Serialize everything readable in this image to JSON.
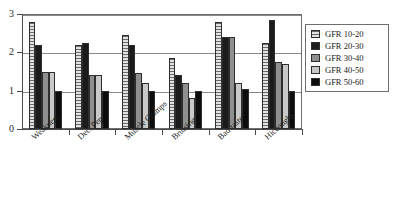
{
  "chart_data": {
    "type": "bar",
    "title": "",
    "subtitle": "",
    "xlabel": "",
    "ylabel": "",
    "ylim": [
      0,
      3
    ],
    "y_ticks": [
      0,
      1,
      2,
      3
    ],
    "y_tick_labels": [
      "0",
      "1",
      "2",
      "3"
    ],
    "grid": true,
    "grid_axis": "y",
    "legend_position": "right",
    "categories": [
      "Weakness",
      "Dec. Pep",
      "Muscle Cramps",
      "Bruising",
      "Bad taste",
      "Hiccoughs"
    ],
    "series": [
      {
        "name": "GFR 10-20",
        "pattern": "horizontal-stripes",
        "color": "#cfcfcf",
        "values": [
          2.8,
          2.2,
          2.45,
          1.85,
          2.8,
          2.25
        ]
      },
      {
        "name": "GFR 20-30",
        "pattern": "solid-dark",
        "color": "#1b1b1b",
        "values": [
          2.2,
          2.25,
          2.2,
          1.4,
          2.4,
          2.85
        ]
      },
      {
        "name": "GFR 30-40",
        "pattern": "solid-medium-gray",
        "color": "#8f8f8f",
        "values": [
          1.5,
          1.4,
          1.45,
          1.2,
          2.4,
          1.75
        ]
      },
      {
        "name": "GFR 40-50",
        "pattern": "solid-light-gray",
        "color": "#c9c9c9",
        "values": [
          1.5,
          1.4,
          1.2,
          0.8,
          1.2,
          1.7
        ]
      },
      {
        "name": "GFR 50-60",
        "pattern": "solid-black",
        "color": "#0d0d0d",
        "values": [
          1.0,
          1.0,
          1.0,
          1.0,
          1.05,
          1.0
        ]
      }
    ]
  },
  "legend": {
    "items": [
      {
        "label": "GFR 10-20"
      },
      {
        "label": "GFR 20-30"
      },
      {
        "label": "GFR 30-40"
      },
      {
        "label": "GFR 40-50"
      },
      {
        "label": "GFR 50-60"
      }
    ]
  }
}
